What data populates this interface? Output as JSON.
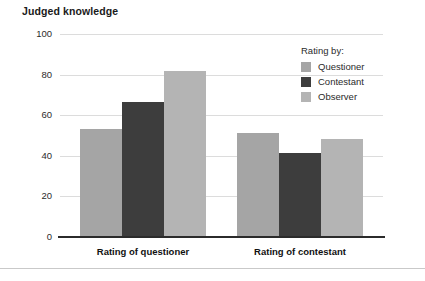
{
  "figure": {
    "title": "Judged knowledge"
  },
  "legend": {
    "title": "Rating by:",
    "position": "top-right",
    "entries": [
      {
        "label": "Questioner",
        "color": "#a5a5a5"
      },
      {
        "label": "Contestant",
        "color": "#3d3d3d"
      },
      {
        "label": "Observer",
        "color": "#b4b4b4"
      }
    ]
  },
  "axes": {
    "y_ticks": [
      "100",
      "80",
      "60",
      "40",
      "20",
      "0"
    ],
    "x_labels": [
      "Rating of questioner",
      "Rating of contestant"
    ]
  },
  "chart_data": {
    "type": "bar",
    "title": "Judged knowledge",
    "xlabel": "",
    "ylabel": "",
    "ylim": [
      0,
      100
    ],
    "yticks": [
      0,
      20,
      40,
      60,
      80,
      100
    ],
    "grid": true,
    "legend_title": "Rating by:",
    "legend_position": "top-right",
    "categories": [
      "Rating of questioner",
      "Rating of contestant"
    ],
    "series": [
      {
        "name": "Questioner",
        "color": "#a5a5a5",
        "values": [
          53,
          51
        ]
      },
      {
        "name": "Contestant",
        "color": "#3d3d3d",
        "values": [
          66.5,
          41.5
        ]
      },
      {
        "name": "Observer",
        "color": "#b4b4b4",
        "values": [
          82,
          48.5
        ]
      }
    ]
  }
}
